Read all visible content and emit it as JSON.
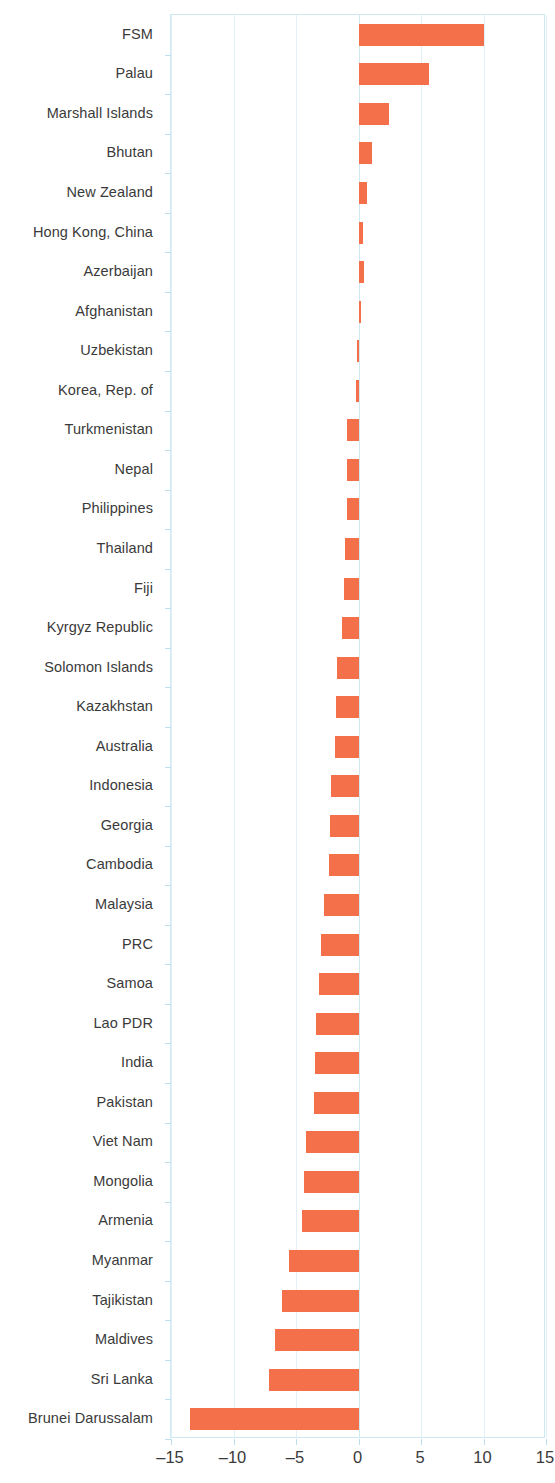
{
  "chart_data": {
    "type": "bar",
    "orientation": "horizontal",
    "title": "",
    "subtitle": "",
    "xlabel": "",
    "ylabel": "",
    "xlim": [
      -15,
      15
    ],
    "xticks": [
      -15,
      -10,
      -5,
      0,
      5,
      10,
      15
    ],
    "xtick_labels": [
      "–15",
      "–10",
      "–5",
      "0",
      "5",
      "10",
      "15"
    ],
    "grid": true,
    "grid_axis": "x",
    "legend": "none",
    "bar_color": "#f4704a",
    "frame_color": "#cde9f2",
    "gridline_color": "#e2f1f7",
    "label_color": "#3a3a3a",
    "categories": [
      "FSM",
      "Palau",
      "Marshall Islands",
      "Bhutan",
      "New Zealand",
      "Hong Kong, China",
      "Azerbaijan",
      "Afghanistan",
      "Uzbekistan",
      "Korea, Rep. of",
      "Turkmenistan",
      "Nepal",
      "Philippines",
      "Thailand",
      "Fiji",
      "Kyrgyz Republic",
      "Solomon Islands",
      "Kazakhstan",
      "Australia",
      "Indonesia",
      "Georgia",
      "Cambodia",
      "Malaysia",
      "PRC",
      "Samoa",
      "Lao PDR",
      "India",
      "Pakistan",
      "Viet Nam",
      "Mongolia",
      "Armenia",
      "Myanmar",
      "Tajikistan",
      "Maldives",
      "Sri Lanka",
      "Brunei Darussalam"
    ],
    "values": [
      10.0,
      5.6,
      2.4,
      1.1,
      0.7,
      0.35,
      0.4,
      0.2,
      -0.15,
      -0.2,
      -0.9,
      -0.9,
      -0.9,
      -1.1,
      -1.2,
      -1.3,
      -1.7,
      -1.8,
      -1.9,
      -2.2,
      -2.3,
      -2.4,
      -2.8,
      -3.0,
      -3.2,
      -3.4,
      -3.5,
      -3.6,
      -4.2,
      -4.4,
      -4.5,
      -5.6,
      -6.1,
      -6.7,
      -7.2,
      -13.5
    ]
  }
}
